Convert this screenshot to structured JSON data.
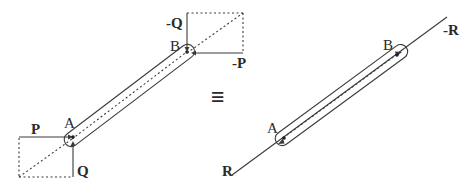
{
  "diagram": {
    "colors": {
      "stroke": "#3a3a3a",
      "text": "#2a2a2a",
      "background": "#ffffff"
    },
    "left_figure": {
      "point_a_label": "A",
      "point_b_label": "B",
      "force_p_label": "P",
      "force_q_label": "Q",
      "force_neg_p_label": "-P",
      "force_neg_q_label": "-Q"
    },
    "equivalence_symbol": "≡",
    "right_figure": {
      "point_a_label": "A",
      "point_b_label": "B",
      "force_r_label": "R",
      "force_neg_r_label": "-R"
    }
  }
}
